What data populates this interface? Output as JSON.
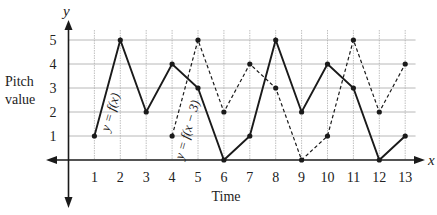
{
  "chart_data": {
    "type": "line",
    "title": "",
    "xlabel": "Time",
    "ylabel": "Pitch value",
    "x_axis_var": "x",
    "y_axis_var": "y",
    "x_ticks": [
      1,
      2,
      3,
      4,
      5,
      6,
      7,
      8,
      9,
      10,
      11,
      12,
      13
    ],
    "y_ticks": [
      1,
      2,
      3,
      4,
      5
    ],
    "xlim": [
      0,
      13
    ],
    "ylim": [
      0,
      5
    ],
    "grid": true,
    "series": [
      {
        "name": "y = f(x)",
        "style": "solid",
        "x": [
          1,
          2,
          3,
          4,
          5,
          6,
          7,
          8,
          9,
          10,
          11,
          12,
          13
        ],
        "y": [
          1,
          5,
          2,
          4,
          3,
          0,
          1,
          5,
          2,
          4,
          3,
          0,
          1
        ]
      },
      {
        "name": "y = f(x − 3)",
        "style": "dashed",
        "x": [
          4,
          5,
          6,
          7,
          8,
          9,
          10,
          11,
          12,
          13
        ],
        "y": [
          1,
          5,
          2,
          4,
          3,
          0,
          1,
          5,
          2,
          4
        ]
      }
    ],
    "annotations": [
      {
        "text": "y = f(x)",
        "near_series": 0
      },
      {
        "text": "y = f(x − 3)",
        "near_series": 1
      }
    ]
  },
  "labels": {
    "y_axis_var": "y",
    "x_axis_var": "x",
    "ylabel_line1": "Pitch",
    "ylabel_line2": "value",
    "xlabel": "Time",
    "series0_label": "y = f(x)",
    "series1_label": "y = f(x − 3)"
  },
  "colors": {
    "line": "#1a1a1a",
    "grid": "#b0b0b0",
    "axis": "#1a1a1a",
    "text": "#222222"
  }
}
